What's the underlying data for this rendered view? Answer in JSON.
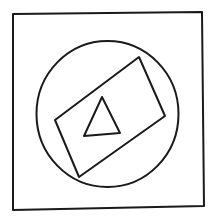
{
  "diagram": {
    "stroke_color": "#1a1a1a",
    "background": "#ffffff",
    "square": {
      "points": "13,14 202,12 204,206 13,210",
      "stroke_width": 2
    },
    "circle": {
      "cx": 107.5,
      "cy": 114,
      "rx": 71,
      "ry": 73,
      "stroke_width": 2
    },
    "rectangle": {
      "points": "139,57 165,116 79,177 55,120",
      "stroke_width": 2
    },
    "triangle": {
      "points": "102,97 120,133 84,136",
      "stroke_width": 2
    }
  }
}
